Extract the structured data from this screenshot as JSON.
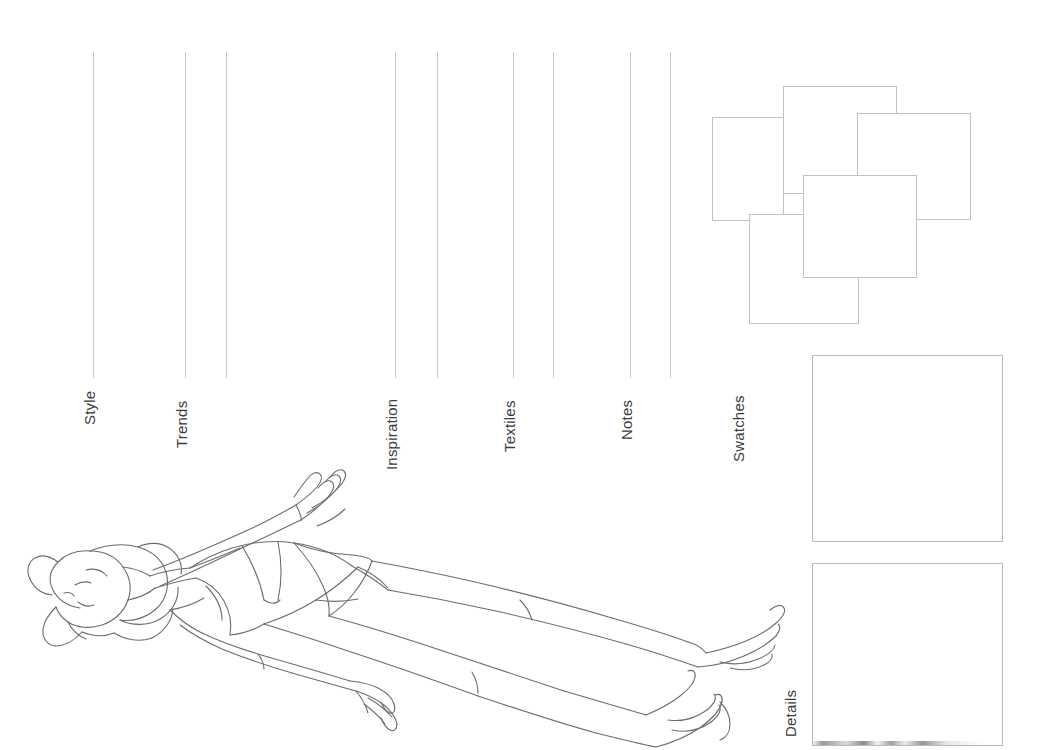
{
  "page": {
    "background_color": "#ffffff",
    "rule_color": "#c9c9cc",
    "outline_color": "#c2c2c6",
    "label_color": "#3b3b3b",
    "width": 1053,
    "height": 750
  },
  "sections": [
    {
      "id": "style",
      "label": "Style",
      "label_x": 82,
      "label_y": 425,
      "rules": [
        {
          "x": 93,
          "y1": 52,
          "y2": 378
        }
      ]
    },
    {
      "id": "trends",
      "label": "Trends",
      "label_x": 174,
      "label_y": 448,
      "rules": [
        {
          "x": 185,
          "y1": 52,
          "y2": 378
        },
        {
          "x": 226,
          "y1": 52,
          "y2": 378
        }
      ]
    },
    {
      "id": "inspiration",
      "label": "Inspiration",
      "label_x": 384,
      "label_y": 470,
      "rules": [
        {
          "x": 395,
          "y1": 52,
          "y2": 378
        },
        {
          "x": 437,
          "y1": 52,
          "y2": 378
        }
      ]
    },
    {
      "id": "textiles",
      "label": "Textiles",
      "label_x": 502,
      "label_y": 452,
      "rules": [
        {
          "x": 513,
          "y1": 52,
          "y2": 378
        },
        {
          "x": 553,
          "y1": 52,
          "y2": 378
        }
      ]
    },
    {
      "id": "notes",
      "label": "Notes",
      "label_x": 619,
      "label_y": 440,
      "rules": [
        {
          "x": 630,
          "y1": 52,
          "y2": 378
        },
        {
          "x": 670,
          "y1": 52,
          "y2": 378
        }
      ]
    },
    {
      "id": "swatches",
      "label": "Swatches",
      "label_x": 731,
      "label_y": 462,
      "rules": []
    },
    {
      "id": "details",
      "label": "Details",
      "label_x": 783,
      "label_y": 737,
      "rules": []
    }
  ],
  "swatch_boxes": [
    {
      "name": "swatch-box-1",
      "x": 712,
      "y": 117,
      "w": 72,
      "h": 104
    },
    {
      "name": "swatch-box-2",
      "x": 783,
      "y": 86,
      "w": 114,
      "h": 108
    },
    {
      "name": "swatch-box-3",
      "x": 857,
      "y": 113,
      "w": 114,
      "h": 107
    },
    {
      "name": "swatch-box-4",
      "x": 749,
      "y": 214,
      "w": 110,
      "h": 110
    },
    {
      "name": "swatch-box-5",
      "x": 803,
      "y": 175,
      "w": 114,
      "h": 103
    }
  ],
  "panels": [
    {
      "name": "details-panel-upper",
      "x": 812,
      "y": 355,
      "w": 191,
      "h": 187
    },
    {
      "name": "details-panel-lower",
      "x": 812,
      "y": 563,
      "w": 191,
      "h": 183
    }
  ],
  "figure": {
    "name": "fashion-croquis",
    "stroke_color": "#6b6b73",
    "orientation": "rotated-90-counterclockwise"
  }
}
